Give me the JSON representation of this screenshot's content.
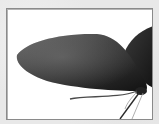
{
  "image": {
    "subject": "dark leaf-shaped petals with thin stems",
    "alt": "Dark gray leaf or wing shapes on a white background inside a framed border",
    "colors": {
      "background": "#e8e8e8",
      "frame_border": "#8a8a8a",
      "canvas": "#ffffff",
      "leaf_dark": "#1e1e1e",
      "leaf_mid": "#4a4a4a",
      "leaf_light": "#6e6e6e",
      "stem": "#555555"
    }
  }
}
